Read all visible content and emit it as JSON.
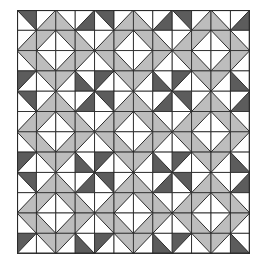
{
  "image": {
    "description": "Quilt pattern: 12x12 grid of half-square triangle cells arranged as 3x3 repeating 4x4 blocks with diamond centers",
    "grid": {
      "rows": 12,
      "cols": 12,
      "block_size": 4,
      "cell_width": 19.4,
      "cell_height": 20.3
    },
    "colors": {
      "background": "#ffffff",
      "dark": "#5c5c5c",
      "light": "#bdbdbd",
      "line": "#2a2a2a"
    },
    "block": [
      [
        {
          "d": "\\",
          "s": "UR",
          "c": "dark"
        },
        {
          "d": "/",
          "s": "LR",
          "c": "light"
        },
        {
          "d": "\\",
          "s": "LL",
          "c": "light"
        },
        {
          "d": "/",
          "s": "LR",
          "c": "dark"
        }
      ],
      [
        {
          "d": "/",
          "s": "LR",
          "c": "light"
        },
        {
          "d": "/",
          "s": "UL",
          "c": "light"
        },
        {
          "d": "\\",
          "s": "UR",
          "c": "light"
        },
        {
          "d": "\\",
          "s": "LL",
          "c": "light"
        }
      ],
      [
        {
          "d": "\\",
          "s": "UR",
          "c": "light"
        },
        {
          "d": "\\",
          "s": "LL",
          "c": "light"
        },
        {
          "d": "/",
          "s": "LR",
          "c": "light"
        },
        {
          "d": "/",
          "s": "UL",
          "c": "light"
        }
      ],
      [
        {
          "d": "/",
          "s": "UL",
          "c": "dark"
        },
        {
          "d": "\\",
          "s": "UR",
          "c": "light"
        },
        {
          "d": "/",
          "s": "UL",
          "c": "light"
        },
        {
          "d": "\\",
          "s": "LL",
          "c": "dark"
        }
      ]
    ]
  }
}
